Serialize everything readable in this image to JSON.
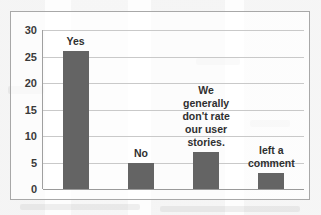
{
  "chart_data": {
    "type": "bar",
    "title": "",
    "xlabel": "",
    "ylabel": "",
    "ylim": [
      0,
      30
    ],
    "grid": true,
    "legend": "none",
    "yticks": [
      "30",
      "25",
      "20",
      "15",
      "10",
      "5",
      "0"
    ],
    "ytick_values": [
      30,
      25,
      20,
      15,
      10,
      5,
      0
    ],
    "categories": [
      "Yes",
      "No",
      "We generally don't rate our user stories.",
      "left a comment"
    ],
    "values": [
      26,
      5,
      7,
      3
    ],
    "bars": [
      {
        "label_lines": [
          "Yes"
        ],
        "value": 26
      },
      {
        "label_lines": [
          "No"
        ],
        "value": 5
      },
      {
        "label_lines": [
          "We",
          "generally",
          "don't rate",
          "our user",
          "stories."
        ],
        "value": 7
      },
      {
        "label_lines": [
          "left a",
          "comment"
        ],
        "value": 3
      }
    ],
    "colors": {
      "bar": "#646464",
      "gridline": "#c9c9c9",
      "axis": "#9a9a9a",
      "border": "#a8a8a8",
      "text": "#2f2f2f",
      "background": "#fdfdfd"
    }
  }
}
